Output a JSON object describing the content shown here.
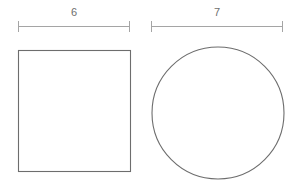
{
  "canvas": {
    "width": 299,
    "height": 192,
    "background": "#ffffff"
  },
  "figure": {
    "type": "geometry-diagram",
    "stroke_color": "#6d6d6d",
    "dimension_color": "#a5a5a5",
    "label_color": "#6e6e6e"
  },
  "shapes": [
    {
      "name": "square",
      "label": "6",
      "dimension_value": "6",
      "x": 18,
      "y": 50,
      "width": 112,
      "height": 121,
      "dimension_line": {
        "x1": 18,
        "x2": 130,
        "y": 26,
        "tick_half_height": 5,
        "label_x": 74,
        "label_y": 13
      }
    },
    {
      "name": "circle",
      "label": "7",
      "dimension_value": "7",
      "cx": 218,
      "cy": 113,
      "r": 66,
      "dimension_line": {
        "x1": 151,
        "x2": 283,
        "y": 26,
        "tick_half_height": 5,
        "label_x": 217,
        "label_y": 13
      }
    }
  ]
}
